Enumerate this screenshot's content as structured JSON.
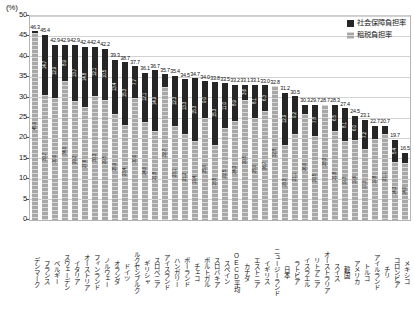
{
  "axis": {
    "unit_label": "(%)",
    "y_ticks": [
      0,
      5,
      10,
      15,
      20,
      25,
      30,
      35,
      40,
      45,
      50
    ]
  },
  "legend": {
    "position": "top-right",
    "items": [
      {
        "key": "social",
        "label": "社会保障負担率",
        "color": "#262626"
      },
      {
        "key": "tax",
        "label": "租税負担率",
        "color": "#a8a8a8"
      }
    ]
  },
  "chart_data": {
    "type": "bar",
    "subtype": "stacked-vertical",
    "title": "",
    "xlabel": "",
    "ylabel": "(%)",
    "ylim": [
      0,
      50
    ],
    "grid": true,
    "legend_position": "top-right",
    "categories": [
      "デンマーク",
      "フランス",
      "ベルギー",
      "スウェーデン",
      "イタリア",
      "オーストリア",
      "フィンランド",
      "ノルウェー",
      "オランダ",
      "ドイツ",
      "ルクセンブルク",
      "ギリシャ",
      "スロベニア",
      "アイスランド",
      "ハンガリー",
      "ポーランド",
      "チェコ",
      "ポルトガル",
      "スロバキア",
      "スペイン",
      "OECD平均",
      "カナダ",
      "エストニア",
      "イギリス",
      "ニュージーランド",
      "日本",
      "ラトビア",
      "イスラエル",
      "リトアニア",
      "オーストラリア",
      "スイス",
      "韓国",
      "アメリカ",
      "トルコ",
      "アイルランド",
      "チリ",
      "コロンビア",
      "メキシコ"
    ],
    "series": [
      {
        "name": "租税負担率",
        "color": "#a8a8a8",
        "values": [
          45.9,
          30.7,
          30.0,
          34.0,
          29.2,
          27.6,
          30.3,
          29.5,
          25.9,
          23.4,
          30.0,
          24.0,
          21.8,
          32.7,
          23.1,
          21.2,
          19.4,
          25.0,
          18.5,
          22.5,
          24.3,
          29.5,
          25.0,
          26.7,
          32.8,
          18.3,
          21.1,
          26.0,
          20.5,
          28.3,
          21.8,
          19.3,
          19.6,
          17.3,
          19.8,
          21.1,
          14.3,
          14.0
        ]
      },
      {
        "name": "社会保障負担率",
        "color": "#262626",
        "values": [
          0.4,
          14.7,
          12.9,
          8.9,
          13.7,
          14.8,
          12.1,
          10.5,
          13.4,
          15.3,
          7.7,
          12.1,
          14.9,
          3.0,
          12.3,
          13.3,
          15.3,
          9.0,
          15.3,
          11.0,
          8.9,
          3.6,
          8.1,
          6.3,
          0.0,
          12.9,
          9.2,
          2.3,
          7.8,
          0.0,
          6.5,
          8.1,
          6.0,
          7.2,
          3.3,
          2.0,
          5.4,
          2.5
        ]
      }
    ],
    "totals": [
      46.3,
      45.4,
      42.9,
      42.9,
      42.9,
      42.4,
      42.4,
      42.0,
      39.3,
      38.7,
      37.7,
      36.1,
      36.7,
      35.7,
      35.4,
      34.5,
      34.7,
      34.0,
      33.8,
      33.5,
      33.2,
      33.1,
      33.1,
      33.0,
      32.8,
      31.2,
      30.3,
      28.3,
      28.3,
      28.3,
      28.3,
      27.4,
      25.6,
      24.5,
      23.1,
      23.1,
      19.7,
      16.5
    ],
    "total_labels": [
      "46.3",
      "45.4",
      "42.9",
      "42.9",
      "42.9",
      "42.4",
      "42.4",
      "42.2",
      "39.3",
      "38.7",
      "37.7",
      "36.1",
      "36.7",
      "35.7",
      "35.4",
      "34.5",
      "34.7",
      "34.0",
      "33.8",
      "33.5",
      "33.2",
      "33.1",
      "33.1",
      "33.0",
      "32.8",
      "31.2",
      "30.5",
      "30.3",
      "29.7",
      "28.7",
      "28.3",
      "27.4",
      "24.5",
      "23.1",
      "22.7",
      "20.7",
      "19.7",
      "16.5"
    ],
    "tax_labels": [
      "45.9",
      "30.7",
      "30.0",
      "34.0",
      "29.2",
      "27.6",
      "30.3",
      "29.5",
      "25.9",
      "23.4",
      "30.0",
      "24.0",
      "21.8",
      "32.7",
      "23.1",
      "21.2",
      "19.4",
      "25.0",
      "18.5",
      "22.5",
      "24.3",
      "29.5",
      "25.0",
      "26.7",
      "32.8",
      "18.3",
      "21.1",
      "26.0",
      "20.5",
      "28.3",
      "21.8",
      "19.3",
      "19.6",
      "17.3",
      "19.8",
      "21.1",
      "14.3",
      "14.0"
    ],
    "social_labels": [
      "0.4",
      "14.7",
      "12.9",
      "8.9",
      "13.7",
      "14.8",
      "12.1",
      "10.5",
      "13.4",
      "15.3",
      "7.7",
      "12.1",
      "14.9",
      "3.0",
      "12.3",
      "13.3",
      "15.3",
      "9.0",
      "15.3",
      "11.0",
      "8.9",
      "3.6",
      "8.1",
      "6.3",
      "",
      "12.9",
      "9.2",
      "2.3",
      "7.8",
      "",
      "6.5",
      "8.1",
      "6.0",
      "7.2",
      "3.3",
      "2.0",
      "5.4",
      "2.5"
    ]
  }
}
